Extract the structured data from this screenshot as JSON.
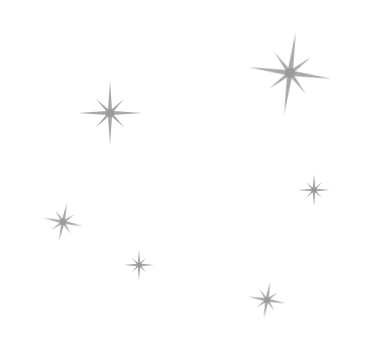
{
  "canvas": {
    "width": 370,
    "height": 360,
    "background": "#ffffff"
  },
  "palette": {
    "star_fill": "#a8a8a8",
    "star_core": "#9a9a9a"
  },
  "stars": [
    {
      "name": "sparkle-large-top-right",
      "icon": "eight-point-star-icon",
      "cx": 290,
      "cy": 73,
      "angle": 8,
      "long": 42,
      "short": 26,
      "width": 5.5
    },
    {
      "name": "sparkle-medium-top-left",
      "icon": "eight-point-star-icon",
      "cx": 110,
      "cy": 113,
      "angle": 0,
      "long": 32,
      "short": 20,
      "width": 4.5
    },
    {
      "name": "sparkle-small-left",
      "icon": "eight-point-star-icon",
      "cx": 63,
      "cy": 222,
      "angle": 12,
      "long": 20,
      "short": 14,
      "width": 3.5
    },
    {
      "name": "sparkle-small-right",
      "icon": "eight-point-star-icon",
      "cx": 314,
      "cy": 190,
      "angle": 0,
      "long": 16,
      "short": 11,
      "width": 3
    },
    {
      "name": "sparkle-tiny-bottom-left",
      "icon": "eight-point-star-icon",
      "cx": 139,
      "cy": 265,
      "angle": 0,
      "long": 15,
      "short": 10,
      "width": 2.8
    },
    {
      "name": "sparkle-small-bottom-right",
      "icon": "eight-point-star-icon",
      "cx": 267,
      "cy": 300,
      "angle": 10,
      "long": 19,
      "short": 13,
      "width": 3.4
    }
  ]
}
